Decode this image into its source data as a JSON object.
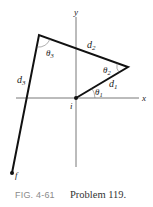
{
  "diagram": {
    "axes": {
      "x_label": "x",
      "y_label": "y"
    },
    "points": {
      "start": "i",
      "end": "f"
    },
    "segments": [
      {
        "name": "d1",
        "label": "d",
        "sub": "1"
      },
      {
        "name": "d2",
        "label": "d",
        "sub": "2"
      },
      {
        "name": "d3",
        "label": "d",
        "sub": "3"
      }
    ],
    "angles": [
      {
        "name": "theta1",
        "label": "θ",
        "sub": "1"
      },
      {
        "name": "theta2",
        "label": "θ",
        "sub": "2"
      },
      {
        "name": "theta3",
        "label": "θ",
        "sub": "3"
      }
    ],
    "colors": {
      "path": "#111111",
      "axis": "#555555",
      "caption_fig": "#8a8a8a"
    }
  },
  "caption": {
    "figure": "FIG. 4-61",
    "text": "Problem 119."
  }
}
